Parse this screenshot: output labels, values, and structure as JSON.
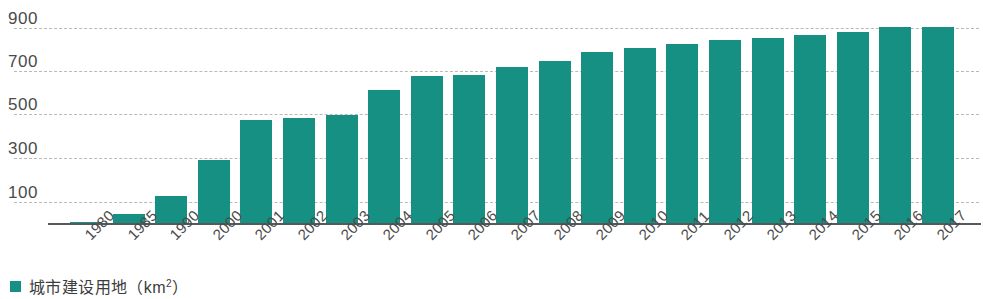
{
  "chart_data": {
    "type": "bar",
    "title": "",
    "xlabel": "",
    "ylabel": "",
    "ylim": [
      0,
      960
    ],
    "yticks": [
      100,
      300,
      500,
      700,
      900
    ],
    "grid": true,
    "legend_position": "bottom-left",
    "bar_color": "#169083",
    "categories": [
      "1980",
      "1985",
      "1990",
      "2000",
      "2001",
      "2002",
      "2003",
      "2004",
      "2005",
      "2006",
      "2007",
      "2008",
      "2009",
      "2010",
      "2011",
      "2012",
      "2013",
      "2014",
      "2015",
      "2016",
      "2017"
    ],
    "series": [
      {
        "name": "城市建设用地（km²）",
        "values": [
          4,
          42,
          125,
          290,
          475,
          485,
          500,
          615,
          680,
          685,
          720,
          750,
          790,
          810,
          825,
          845,
          855,
          870,
          880,
          905,
          905
        ]
      }
    ]
  },
  "axis": {
    "y_tick_labels": [
      "900",
      "700",
      "500",
      "300",
      "100"
    ],
    "x_tick_labels": [
      "1980",
      "1985",
      "1990",
      "2000",
      "2001",
      "2002",
      "2003",
      "2004",
      "2005",
      "2006",
      "2007",
      "2008",
      "2009",
      "2010",
      "2011",
      "2012",
      "2013",
      "2014",
      "2015",
      "2016",
      "2017"
    ]
  },
  "legend": {
    "items": [
      {
        "label_main": "城市建设用地（km",
        "label_sup": "2",
        "label_tail": "）",
        "color": "#169083"
      }
    ]
  }
}
